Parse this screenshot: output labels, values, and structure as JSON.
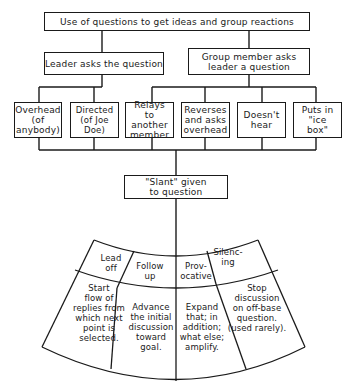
{
  "root": {
    "label": "Use of questions to get ideas and group reactions"
  },
  "branches": [
    {
      "label": "Leader asks the question"
    },
    {
      "label": "Group member asks leader a question"
    }
  ],
  "leaves": [
    {
      "label": "Overhead (of anybody)"
    },
    {
      "label": "Directed (of Joe Doe)"
    },
    {
      "label": "Relays to another member"
    },
    {
      "label": "Reverses and asks overhead"
    },
    {
      "label": "Doesn't hear"
    },
    {
      "label": "Puts in \"ice box\""
    }
  ],
  "slant": {
    "label": "\"Slant\" given to question"
  },
  "fan": {
    "types": [
      {
        "name": "Lead off",
        "line1": "Lead",
        "line2": "off",
        "desc": [
          "Start",
          "flow of",
          "replies from",
          "which next",
          "point is",
          "selected."
        ]
      },
      {
        "name": "Follow up",
        "line1": "Follow",
        "line2": "up",
        "desc": [
          "Advance",
          "the initial",
          "discussion",
          "toward",
          "goal."
        ]
      },
      {
        "name": "Provocative",
        "line1": "Prov-",
        "line2": "ocative",
        "desc": [
          "Expand",
          "that; in",
          "addition;",
          "what else;",
          "amplify."
        ]
      },
      {
        "name": "Silencing",
        "line1": "Silenc-",
        "line2": "ing",
        "desc": [
          "Stop",
          "discussion",
          "on off-base",
          "question.",
          "(used rarely)."
        ]
      }
    ]
  }
}
